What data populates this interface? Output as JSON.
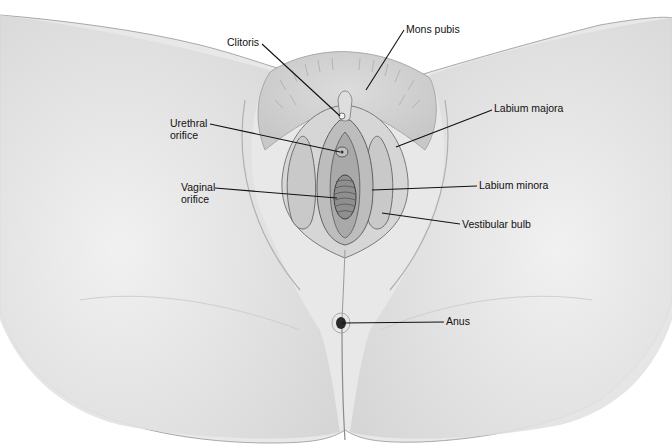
{
  "figure": {
    "type": "anatomical-illustration"
  },
  "labels": [
    {
      "id": "clitoris",
      "text": "Clitoris",
      "x": 227,
      "y": 36,
      "line": [
        [
          262,
          44
        ],
        [
          340,
          116
        ]
      ]
    },
    {
      "id": "mons-pubis",
      "text": "Mons pubis",
      "x": 406,
      "y": 23,
      "line": [
        [
          404,
          30
        ],
        [
          366,
          90
        ]
      ]
    },
    {
      "id": "urethral-orifice",
      "text": "Urethral\norifice",
      "x": 170,
      "y": 117,
      "line": [
        [
          210,
          124
        ],
        [
          340,
          152
        ]
      ]
    },
    {
      "id": "labium-majora",
      "text": "Labium majora",
      "x": 494,
      "y": 102,
      "line": [
        [
          492,
          110
        ],
        [
          396,
          147
        ]
      ]
    },
    {
      "id": "vaginal-orifice",
      "text": "Vaginal\norifice",
      "x": 181,
      "y": 181,
      "line": [
        [
          215,
          188
        ],
        [
          337,
          198
        ]
      ]
    },
    {
      "id": "labium-minora",
      "text": "Labium minora",
      "x": 479,
      "y": 179,
      "line": [
        [
          477,
          186
        ],
        [
          372,
          190
        ]
      ]
    },
    {
      "id": "vestibular-bulb",
      "text": "Vestibular bulb",
      "x": 462,
      "y": 218,
      "line": [
        [
          460,
          224
        ],
        [
          382,
          213
        ]
      ]
    },
    {
      "id": "anus",
      "text": "Anus",
      "x": 446,
      "y": 315,
      "line": [
        [
          444,
          322
        ],
        [
          342,
          323
        ]
      ]
    }
  ],
  "colors": {
    "background": "#ffffff",
    "skin": "#e6e6e6",
    "shadow": "#b9b9b9",
    "line": "#111111"
  }
}
